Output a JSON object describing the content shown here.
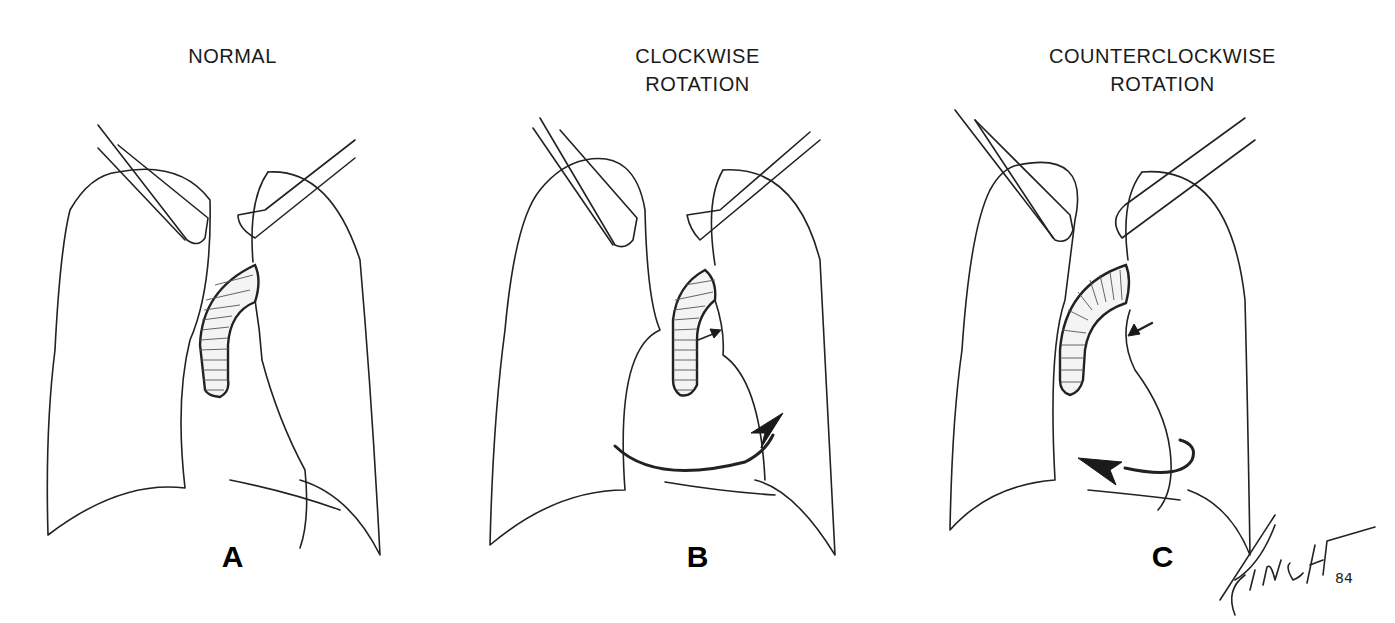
{
  "figure": {
    "panels": [
      {
        "id": "A",
        "title_lines": [
          "NORMAL"
        ],
        "letter": "A"
      },
      {
        "id": "B",
        "title_lines": [
          "CLOCKWISE",
          "ROTATION"
        ],
        "letter": "B"
      },
      {
        "id": "C",
        "title_lines": [
          "COUNTERCLOCKWISE",
          "ROTATION"
        ],
        "letter": "C"
      }
    ],
    "signature": {
      "name": "FINCH",
      "year": "84"
    },
    "icons": {
      "clockwise": "curved-arrow-right",
      "counterclockwise": "curved-arrow-left"
    }
  }
}
